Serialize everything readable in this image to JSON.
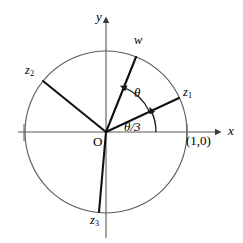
{
  "figure": {
    "background_color": "#ffffff",
    "stroke_color": "#1a1a1a",
    "circle_color": "#555555",
    "axis_color": "#555555",
    "center": {
      "x": 106,
      "y": 132
    },
    "radius": 81
  },
  "axes": {
    "x": {
      "label": "x",
      "label_pos": {
        "x": 228,
        "y": 124
      },
      "start": {
        "x": 18,
        "y": 132
      },
      "end": {
        "x": 222,
        "y": 132
      },
      "arrow": true
    },
    "y": {
      "label": "y",
      "label_pos": {
        "x": 96,
        "y": 10
      },
      "start": {
        "x": 106,
        "y": 238
      },
      "end": {
        "x": 106,
        "y": 16
      },
      "arrow": true
    }
  },
  "origin": {
    "label": "O",
    "label_pos": {
      "x": 93,
      "y": 135
    }
  },
  "unit_point": {
    "label": "(1,0)",
    "label_pos": {
      "x": 186,
      "y": 134
    },
    "tick": {
      "x": 187,
      "y": 132
    }
  },
  "vectors": [
    {
      "name": "w",
      "label": "w",
      "subscript": "",
      "angle_deg": 68,
      "label_pos": {
        "x": 134,
        "y": 34
      },
      "tip": {
        "x": 136,
        "y": 57
      }
    },
    {
      "name": "z1",
      "label": "z",
      "subscript": "1",
      "angle_deg": 25,
      "label_pos": {
        "x": 183,
        "y": 86
      },
      "tip": {
        "x": 179,
        "y": 98
      }
    },
    {
      "name": "z2",
      "label": "z",
      "subscript": "2",
      "angle_deg": 141,
      "label_pos": {
        "x": 25,
        "y": 64
      },
      "tip": {
        "x": 43,
        "y": 81
      }
    },
    {
      "name": "z3",
      "label": "z",
      "subscript": "3",
      "angle_deg": 265,
      "label_pos": {
        "x": 90,
        "y": 214
      },
      "tip": {
        "x": 99,
        "y": 212
      }
    }
  ],
  "angle_arcs": [
    {
      "name": "theta",
      "label": "θ",
      "label_pos": {
        "x": 134,
        "y": 86
      },
      "from_deg": 25,
      "to_deg": 68,
      "arc_radius": 48,
      "arrow_at": "to"
    },
    {
      "name": "theta-over-three",
      "label": "θ/3",
      "label_pos": {
        "x": 124,
        "y": 120
      },
      "from_deg": 0,
      "to_deg": 25,
      "arc_radius": 50,
      "arrow_at": "to"
    }
  ]
}
